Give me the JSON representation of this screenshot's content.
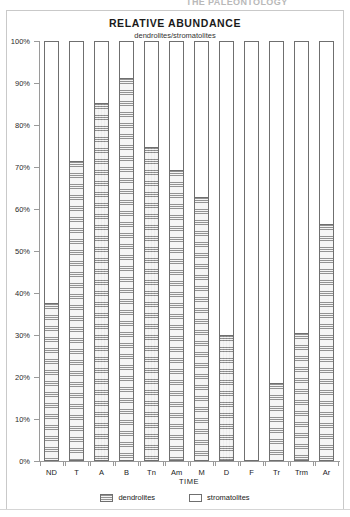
{
  "page": {
    "cutoff_header": "THE PALEONTOLOGY"
  },
  "chart_data": {
    "type": "bar",
    "title": "RELATIVE ABUNDANCE",
    "subtitle": "dendrolites/stromatolites",
    "xlabel": "TIME",
    "ylabel": "",
    "ylim": [
      0,
      100
    ],
    "grid": false,
    "stacked": true,
    "stack_total": 100,
    "legend_position": "bottom",
    "ytick_labels": [
      "0%",
      "10%",
      "20%",
      "30%",
      "40%",
      "50%",
      "60%",
      "70%",
      "80%",
      "90%",
      "100%"
    ],
    "ytick_values": [
      0,
      10,
      20,
      30,
      40,
      50,
      60,
      70,
      80,
      90,
      100
    ],
    "categories": [
      "ND",
      "T",
      "A",
      "B",
      "Tn",
      "Am",
      "M",
      "D",
      "F",
      "Tr",
      "Trm",
      "Ar"
    ],
    "series": [
      {
        "name": "dendrolites",
        "fill": "hatched",
        "color": "#d8d8d8",
        "values": [
          37.5,
          71.5,
          85.5,
          91.5,
          75.0,
          69.5,
          63.0,
          30.0,
          0.0,
          18.5,
          30.5,
          56.5
        ]
      },
      {
        "name": "stromatolites",
        "fill": "solid",
        "color": "#ffffff",
        "values": [
          62.5,
          28.5,
          14.5,
          8.5,
          25.0,
          30.5,
          37.0,
          70.0,
          100.0,
          81.5,
          69.5,
          43.5
        ]
      }
    ],
    "legend": [
      {
        "label": "dendrolites",
        "swatch": "hatched"
      },
      {
        "label": "stromatolites",
        "swatch": "solid"
      }
    ]
  }
}
